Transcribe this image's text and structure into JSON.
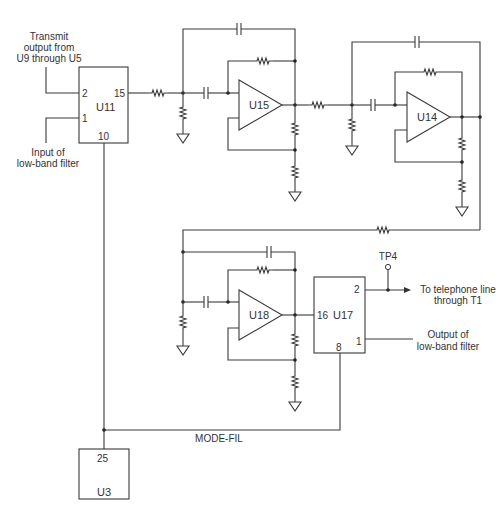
{
  "diagram": {
    "type": "circuit-schematic"
  },
  "labels": {
    "transmit_in": [
      "Transmit",
      "output from",
      "U9 through U5"
    ],
    "lowband_in": [
      "Input of",
      "low-band filter"
    ],
    "telephone_out": [
      "To telephone line",
      "through T1"
    ],
    "lowband_out": [
      "Output of",
      "low-band filter"
    ],
    "mode_fil": "MODE-FIL",
    "test_point": "TP4"
  },
  "components": {
    "u11": {
      "ref": "U11",
      "pin_2": "2",
      "pin_1": "1",
      "pin_15": "15",
      "pin_10": "10"
    },
    "u15": {
      "ref": "U15"
    },
    "u14": {
      "ref": "U14"
    },
    "u18": {
      "ref": "U18"
    },
    "u17": {
      "ref": "U17",
      "pin_2": "2",
      "pin_16": "16",
      "pin_1": "1",
      "pin_8": "8"
    },
    "u3": {
      "ref": "U3",
      "pin_25": "25"
    }
  },
  "colors": {
    "line": "#3a3a3a",
    "text": "#333333",
    "background": "#ffffff"
  }
}
